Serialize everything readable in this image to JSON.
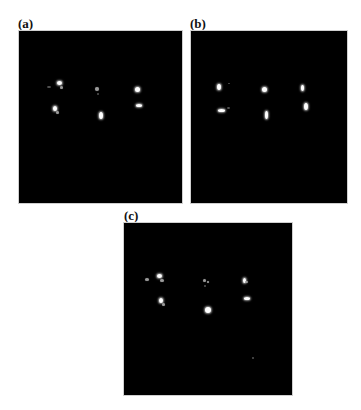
{
  "figure": {
    "panels": [
      {
        "id": "a",
        "label": "(a)",
        "description": "Dark field image with six bright speckle clusters arranged in 2 rows x 3 columns"
      },
      {
        "id": "b",
        "label": "(b)",
        "description": "Dark field image with six bright speckle clusters arranged in 2 rows x 3 columns"
      },
      {
        "id": "c",
        "label": "(c)",
        "description": "Dark field image with six bright speckle clusters arranged in 2 rows x 3 columns"
      }
    ]
  }
}
